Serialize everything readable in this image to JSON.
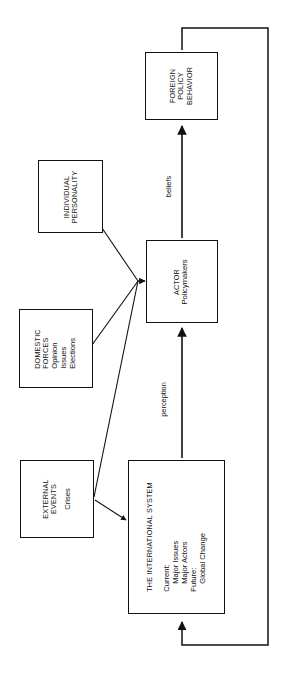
{
  "diagram": {
    "type": "flow-diagram",
    "orientation": "rotated-90-ccw",
    "title_present": false,
    "boxes": {
      "foreign_policy_behavior": {
        "lines": [
          "FOREIGN",
          "POLICY",
          "BEHAVIOR"
        ]
      },
      "individual_personality": {
        "lines": [
          "INDIVIDUAL",
          "PERSONALITY"
        ]
      },
      "actor": {
        "lines": [
          "ACTOR",
          "Policymakers"
        ]
      },
      "domestic_forces": {
        "lines": [
          "DOMESTIC",
          "FORCES",
          "Opinion",
          "Issues",
          "Elections"
        ]
      },
      "external_events": {
        "lines": [
          "EXTERNAL",
          "EVENTS",
          "Crises"
        ]
      },
      "international_system": {
        "lines": [
          "THE INTERNATIONAL SYSTEM",
          "Current:",
          "Major Issues",
          "Major Actors",
          "Future:",
          "Global Change"
        ]
      }
    },
    "edge_labels": {
      "perception": "perception",
      "beliefs": "beliefs"
    },
    "colors": {
      "stroke": "#111111",
      "background": "#ffffff"
    }
  }
}
